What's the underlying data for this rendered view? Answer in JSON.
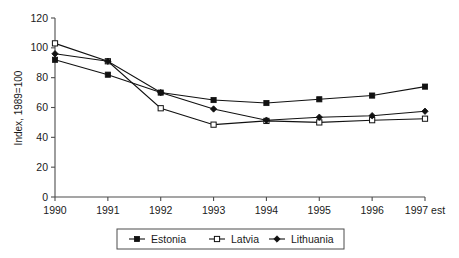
{
  "chart_data": {
    "type": "line",
    "title": "",
    "xlabel": "",
    "ylabel": "Index, 1989=100",
    "categories": [
      "1990",
      "1991",
      "1992",
      "1993",
      "1994",
      "1995",
      "1996",
      "1997 est"
    ],
    "ylim": [
      0,
      120
    ],
    "yticks": [
      0,
      20,
      40,
      60,
      80,
      100,
      120
    ],
    "ytick_labels": [
      "0",
      "20",
      "40",
      "60",
      "80",
      "100",
      "120"
    ],
    "grid": false,
    "legend_position": "bottom",
    "series": [
      {
        "name": "Estonia",
        "marker": "filled-square",
        "values": [
          92,
          82,
          70,
          65,
          63,
          65.5,
          68,
          74
        ]
      },
      {
        "name": "Latvia",
        "marker": "open-square",
        "values": [
          103,
          91,
          59.5,
          48.5,
          51,
          50,
          51.5,
          52.5
        ]
      },
      {
        "name": "Lithuania",
        "marker": "filled-diamond",
        "values": [
          96,
          91,
          70,
          59,
          51.5,
          53.5,
          54.5,
          57.5
        ]
      }
    ]
  },
  "colors": {
    "line": "#111111",
    "axis": "#4d4d4d",
    "text": "#1a1a1a",
    "background": "#ffffff"
  }
}
